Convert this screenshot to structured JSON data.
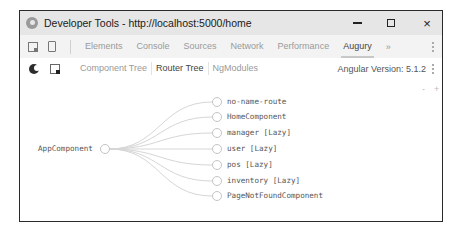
{
  "window": {
    "title": "Developer Tools - http://localhost:5000/home",
    "controls": {
      "minimize": "minimize",
      "maximize": "maximize",
      "close": "×"
    }
  },
  "devtools_tabs": {
    "items": [
      {
        "label": "Elements",
        "active": false
      },
      {
        "label": "Console",
        "active": false
      },
      {
        "label": "Sources",
        "active": false
      },
      {
        "label": "Network",
        "active": false
      },
      {
        "label": "Performance",
        "active": false
      },
      {
        "label": "Augury",
        "active": true
      }
    ],
    "more": "»"
  },
  "augury": {
    "tabs": [
      {
        "label": "Component Tree",
        "active": false
      },
      {
        "label": "Router Tree",
        "active": true
      },
      {
        "label": "NgModules",
        "active": false
      }
    ],
    "version_label": "Angular Version: 5.1.2"
  },
  "router_tree": {
    "zoom_out": "-",
    "zoom_in": "+",
    "root": {
      "label": "AppComponent"
    },
    "children": [
      {
        "label": "no-name-route"
      },
      {
        "label": "HomeComponent"
      },
      {
        "label": "manager [Lazy]"
      },
      {
        "label": "user [Lazy]"
      },
      {
        "label": "pos [Lazy]"
      },
      {
        "label": "inventory [Lazy]"
      },
      {
        "label": "PageNotFoundComponent"
      }
    ]
  }
}
